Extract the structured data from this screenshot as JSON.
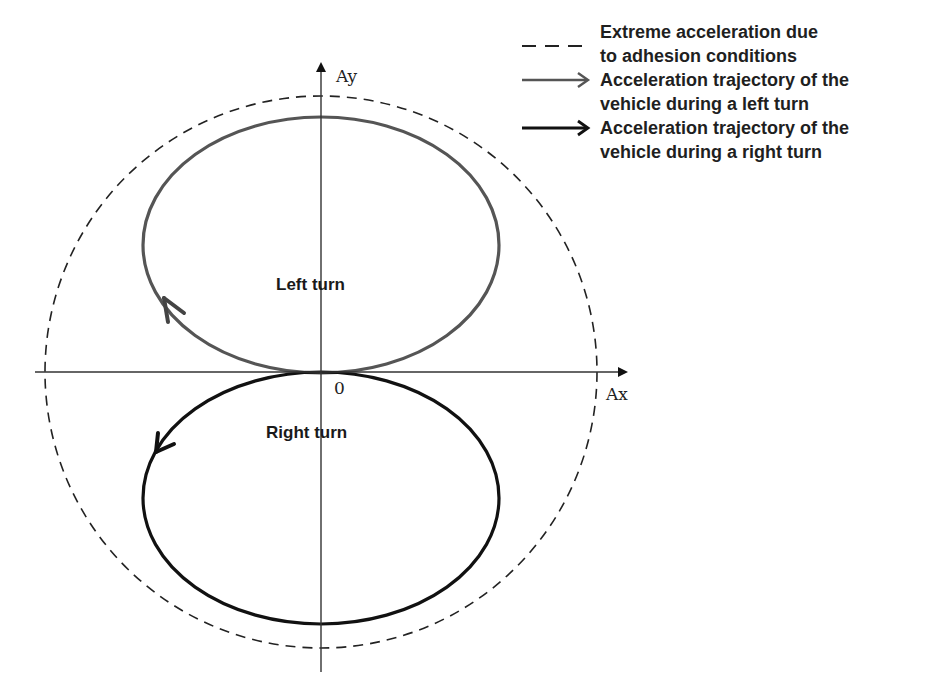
{
  "diagram": {
    "axes": {
      "x_label": "Ax",
      "y_label": "Ay",
      "origin_label": "0"
    },
    "regions": {
      "left_turn_label": "Left turn",
      "right_turn_label": "Right turn"
    },
    "shapes": {
      "adhesion_circle": {
        "style": "dashed",
        "color": "#222222"
      },
      "left_turn_trajectory": {
        "style": "solid",
        "color": "#555555",
        "direction": "counterclockwise-arrow at lower-left"
      },
      "right_turn_trajectory": {
        "style": "solid",
        "color": "#111111",
        "direction": "arrow at upper-left pointing down"
      }
    }
  },
  "legend": {
    "items": [
      {
        "symbol": "dashed-line",
        "label_line1": "Extreme acceleration due",
        "label_line2": "to adhesion conditions",
        "color": "#222222"
      },
      {
        "symbol": "arrow",
        "label_line1": "Acceleration trajectory of the",
        "label_line2": "vehicle during a left turn",
        "color": "#555555"
      },
      {
        "symbol": "arrow",
        "label_line1": "Acceleration trajectory of the",
        "label_line2": "vehicle during a right turn",
        "color": "#111111"
      }
    ]
  }
}
